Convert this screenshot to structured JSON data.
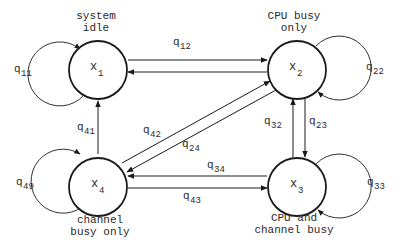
{
  "diagram": {
    "type": "state-transition-diagram",
    "nodes": [
      {
        "id": "x1",
        "symbol": "x",
        "sub": "1",
        "caption": [
          "system",
          "idle"
        ]
      },
      {
        "id": "x2",
        "symbol": "x",
        "sub": "2",
        "caption": [
          "CPU busy",
          "only"
        ]
      },
      {
        "id": "x3",
        "symbol": "x",
        "sub": "3",
        "caption": [
          "CPU and",
          "channel busy"
        ]
      },
      {
        "id": "x4",
        "symbol": "x",
        "sub": "4",
        "caption": [
          "channel",
          "busy only"
        ]
      }
    ],
    "edges": [
      {
        "from": "x1",
        "to": "x1",
        "label": "q",
        "sub": "11"
      },
      {
        "from": "x1",
        "to": "x2",
        "label": "q",
        "sub": "12"
      },
      {
        "from": "x2",
        "to": "x1",
        "label": "",
        "sub": ""
      },
      {
        "from": "x2",
        "to": "x2",
        "label": "q",
        "sub": "22"
      },
      {
        "from": "x2",
        "to": "x3",
        "label": "q",
        "sub": "23"
      },
      {
        "from": "x3",
        "to": "x2",
        "label": "q",
        "sub": "32"
      },
      {
        "from": "x2",
        "to": "x4",
        "label": "q",
        "sub": "24"
      },
      {
        "from": "x4",
        "to": "x2",
        "label": "q",
        "sub": "42"
      },
      {
        "from": "x3",
        "to": "x3",
        "label": "q",
        "sub": "33"
      },
      {
        "from": "x3",
        "to": "x4",
        "label": "q",
        "sub": "34"
      },
      {
        "from": "x4",
        "to": "x3",
        "label": "q",
        "sub": "43"
      },
      {
        "from": "x4",
        "to": "x1",
        "label": "q",
        "sub": "41"
      },
      {
        "from": "x4",
        "to": "x4",
        "label": "q",
        "sub": "49"
      }
    ]
  },
  "labels": {
    "x1_caption_1": "system",
    "x1_caption_2": "idle",
    "x2_caption_1": "CPU busy",
    "x2_caption_2": "only",
    "x3_caption_1": "CPU and",
    "x3_caption_2": "channel busy",
    "x4_caption_1": "channel",
    "x4_caption_2": "busy only",
    "node_symbol": "x",
    "x1_sub": "1",
    "x2_sub": "2",
    "x3_sub": "3",
    "x4_sub": "4",
    "q": "q",
    "q11": "11",
    "q12": "12",
    "q22": "22",
    "q23": "23",
    "q32": "32",
    "q24": "24",
    "q42": "42",
    "q33": "33",
    "q34": "34",
    "q43": "43",
    "q41": "41",
    "q49": "49"
  },
  "colors": {
    "stroke": "#1a1a1a",
    "text": "#2a2a2a",
    "background": "#ffffff"
  }
}
